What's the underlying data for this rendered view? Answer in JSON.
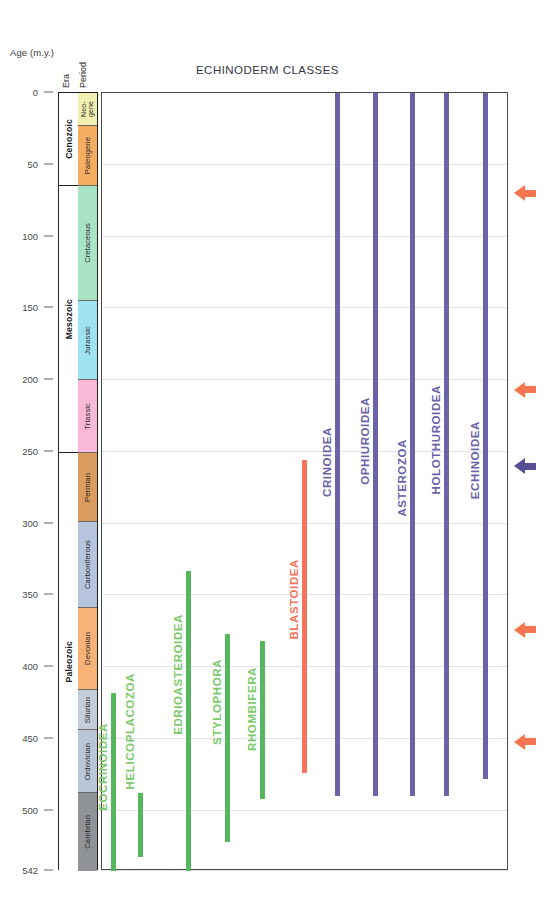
{
  "chart_data": {
    "type": "bar",
    "title": "ECHINODERM CLASSES",
    "ylabel": "Age (m.y.)",
    "ylim": [
      0,
      542
    ],
    "y_inverted": true,
    "grid": true,
    "legend": "none",
    "tick_labels": [
      "0",
      "50",
      "100",
      "150",
      "200",
      "250",
      "300",
      "350",
      "400",
      "450",
      "500",
      "542"
    ],
    "tick_values": [
      0,
      50,
      100,
      150,
      200,
      250,
      300,
      350,
      400,
      450,
      500,
      542
    ],
    "column_headers": {
      "era": "Era",
      "period": "Period"
    },
    "eras": [
      {
        "name": "Cenozoic",
        "start": 0,
        "end": 65,
        "color": "#ffffff"
      },
      {
        "name": "Mesozoic",
        "start": 65,
        "end": 251,
        "color": "#ffffff"
      },
      {
        "name": "Paleozoic",
        "start": 251,
        "end": 542,
        "color": "#ffffff"
      }
    ],
    "periods": [
      {
        "name": "Neo-\ngene",
        "label": "Neo-gene",
        "start": 0,
        "end": 23,
        "color": "#f2f0b0"
      },
      {
        "name": "Paleogene",
        "start": 23,
        "end": 65,
        "color": "#f5ae61"
      },
      {
        "name": "Cretaceous",
        "start": 65,
        "end": 145,
        "color": "#a8e4c4"
      },
      {
        "name": "Jurassic",
        "start": 145,
        "end": 200,
        "color": "#9fe3f2"
      },
      {
        "name": "Triassic",
        "start": 200,
        "end": 251,
        "color": "#f9b8d8"
      },
      {
        "name": "Permian",
        "start": 251,
        "end": 299,
        "color": "#d99c5e"
      },
      {
        "name": "Carboniferous",
        "start": 299,
        "end": 359,
        "color": "#b6c5dd"
      },
      {
        "name": "Devonian",
        "start": 359,
        "end": 416,
        "color": "#f7b377"
      },
      {
        "name": "Silurian",
        "start": 416,
        "end": 444,
        "color": "#c3ccd9"
      },
      {
        "name": "Ordovician",
        "start": 444,
        "end": 488,
        "color": "#b9c6d6"
      },
      {
        "name": "Cambrian",
        "start": 488,
        "end": 542,
        "color": "#8f9296"
      }
    ],
    "ranges": [
      {
        "label": "EOCRINOIDEA",
        "group": "extinct-green",
        "color": "#56b75c",
        "label_color": "#7bc96a",
        "top_age": 418,
        "bottom_age": 542,
        "x_px": 110,
        "label_top_px": 722
      },
      {
        "label": "HELICOPLACOZOA",
        "group": "extinct-green",
        "color": "#56b75c",
        "label_color": "#7bc96a",
        "top_age": 488,
        "bottom_age": 532,
        "x_px": 137,
        "label_top_px": 672
      },
      {
        "label": "EDRIOASTEROIDEA",
        "group": "extinct-green",
        "color": "#56b75c",
        "label_color": "#7bc96a",
        "top_age": 333,
        "bottom_age": 542,
        "x_px": 185,
        "label_top_px": 613
      },
      {
        "label": "STYLOPHORA",
        "group": "extinct-green",
        "color": "#56b75c",
        "label_color": "#7bc96a",
        "top_age": 377,
        "bottom_age": 522,
        "x_px": 224,
        "label_top_px": 658
      },
      {
        "label": "RHOMBIFERA",
        "group": "extinct-green",
        "color": "#56b75c",
        "label_color": "#7bc96a",
        "top_age": 382,
        "bottom_age": 492,
        "x_px": 259,
        "label_top_px": 666
      },
      {
        "label": "BLASTOIDEA",
        "group": "extinct-orange",
        "color": "#f4755c",
        "label_color": "#f4755c",
        "top_age": 256,
        "bottom_age": 474,
        "x_px": 301,
        "label_top_px": 558
      },
      {
        "label": "CRINOIDEA",
        "group": "extant-purple",
        "color": "#6b62a8",
        "label_color": "#6b62a8",
        "top_age": 0,
        "bottom_age": 490,
        "x_px": 334,
        "label_top_px": 426
      },
      {
        "label": "OPHIUROIDEA",
        "group": "extant-purple",
        "color": "#6b62a8",
        "label_color": "#6b62a8",
        "top_age": 0,
        "bottom_age": 490,
        "x_px": 372,
        "label_top_px": 396
      },
      {
        "label": "ASTEROZOA",
        "group": "extant-purple",
        "color": "#6b62a8",
        "label_color": "#6b62a8",
        "top_age": 0,
        "bottom_age": 490,
        "x_px": 409,
        "label_top_px": 438
      },
      {
        "label": "HOLOTHUROIDEA",
        "group": "extant-purple",
        "color": "#6b62a8",
        "label_color": "#6b62a8",
        "top_age": 0,
        "bottom_age": 490,
        "x_px": 443,
        "label_top_px": 384
      },
      {
        "label": "ECHINOIDEA",
        "group": "extant-purple",
        "color": "#6b62a8",
        "label_color": "#6b62a8",
        "top_age": 0,
        "bottom_age": 478,
        "x_px": 482,
        "label_top_px": 420
      }
    ],
    "event_arrows": [
      {
        "age": 65,
        "color": "#f4754f",
        "name": "end-cretaceous-event"
      },
      {
        "age": 202,
        "color": "#f4754f",
        "name": "end-triassic-event"
      },
      {
        "age": 255,
        "color": "#564f96",
        "name": "mid-permian-event"
      },
      {
        "age": 369,
        "color": "#f4754f",
        "name": "late-devonian-event"
      },
      {
        "age": 447,
        "color": "#f4754f",
        "name": "end-ordovician-event"
      }
    ]
  }
}
